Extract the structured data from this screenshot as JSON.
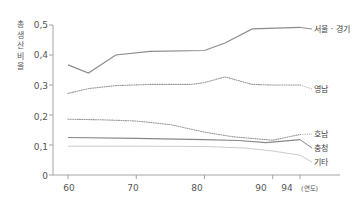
{
  "page": {
    "title_strip": "",
    "footer_strip": ""
  },
  "axis": {
    "ylabel_chars": [
      "총",
      "생",
      "산",
      "비",
      "율"
    ],
    "ylabel_text": "총생산비율",
    "yticks": [
      "0,5",
      "0,4",
      "0,3",
      "0,2",
      "0,1",
      "0"
    ],
    "xticks": [
      "60",
      "70",
      "80",
      "90",
      "94"
    ],
    "xunit": "(연도)"
  },
  "series_labels": {
    "seoul": "서울 · 경기",
    "yeongnam": "영남",
    "honam": "호남",
    "chungcheong": "충청",
    "gita": "기타"
  },
  "chart_data": {
    "type": "line",
    "title": "",
    "xlabel": "(연도)",
    "ylabel": "총생산비율",
    "xlim": [
      58,
      95
    ],
    "ylim": [
      0,
      0.52
    ],
    "xticks": [
      60,
      70,
      80,
      90,
      94
    ],
    "ytick_values": [
      0.5,
      0.4,
      0.3,
      0.2,
      0.1,
      0
    ],
    "ytick_labels": [
      "0,5",
      "0,4",
      "0,3",
      "0,2",
      "0,1",
      "0"
    ],
    "grid": false,
    "legend_position": "right-inline",
    "series": [
      {
        "name": "서울 · 경기",
        "style": "solid",
        "color": "#8c8c8c",
        "x": [
          60,
          63,
          67,
          72,
          80,
          83,
          87,
          94
        ],
        "values": [
          0.367,
          0.34,
          0.4,
          0.412,
          0.415,
          0.44,
          0.487,
          0.492
        ]
      },
      {
        "name": "영남",
        "style": "dotted",
        "color": "#9a9a9a",
        "x": [
          60,
          63,
          67,
          72,
          78,
          80,
          83,
          87,
          90,
          94
        ],
        "values": [
          0.272,
          0.288,
          0.298,
          0.302,
          0.302,
          0.308,
          0.327,
          0.302,
          0.3,
          0.3
        ]
      },
      {
        "name": "호남",
        "style": "dotted",
        "color": "#9a9a9a",
        "x": [
          60,
          65,
          70,
          75,
          80,
          84,
          88,
          90,
          94
        ],
        "values": [
          0.186,
          0.184,
          0.18,
          0.168,
          0.143,
          0.128,
          0.12,
          0.116,
          0.135
        ]
      },
      {
        "name": "충청",
        "style": "solid",
        "color": "#888888",
        "x": [
          60,
          70,
          80,
          85,
          89,
          94
        ],
        "values": [
          0.125,
          0.122,
          0.118,
          0.115,
          0.108,
          0.118
        ]
      },
      {
        "name": "기타",
        "style": "solid-light",
        "color": "#cccccc",
        "x": [
          60,
          70,
          80,
          86,
          90,
          94
        ],
        "values": [
          0.096,
          0.096,
          0.095,
          0.09,
          0.08,
          0.066
        ]
      }
    ]
  }
}
